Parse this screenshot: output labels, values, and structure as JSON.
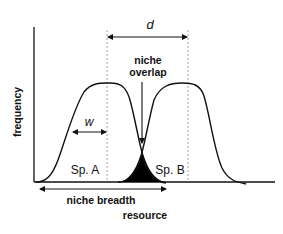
{
  "diagram": {
    "axes": {
      "y_label": "frequency",
      "x_label": "resource"
    },
    "labels": {
      "distance": "d",
      "width": "w",
      "overlap_line1": "niche",
      "overlap_line2": "overlap",
      "species_a": "Sp. A",
      "species_b": "Sp. B",
      "niche_breadth": "niche breadth"
    },
    "colors": {
      "line": "#111111",
      "overlap_fill": "#000000",
      "dashed": "#888888",
      "background": "#ffffff"
    }
  }
}
